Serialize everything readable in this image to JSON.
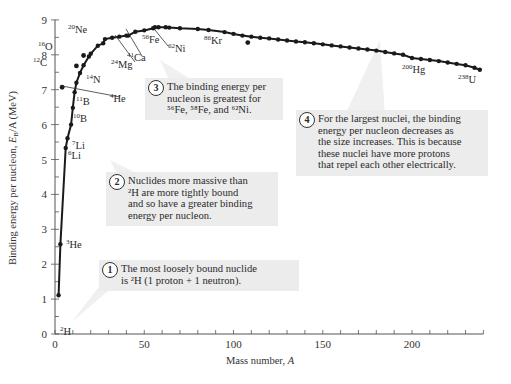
{
  "chart_data": {
    "type": "scatter",
    "title": "",
    "xlabel": "Mass number, A",
    "ylabel": "Binding energy per nucleon, E_B/A (MeV)",
    "xlim": [
      0,
      240
    ],
    "ylim": [
      0,
      9
    ],
    "x_ticks": [
      0,
      50,
      100,
      150,
      200
    ],
    "y_ticks": [
      0,
      1,
      2,
      3,
      4,
      5,
      6,
      7,
      8,
      9
    ],
    "grid": false,
    "labeled_points": [
      {
        "label": "2H",
        "mass": 2,
        "A": 2,
        "E": 1.11
      },
      {
        "label": "3He",
        "mass": 3,
        "A": 3,
        "E": 2.57
      },
      {
        "label": "4He",
        "mass": 4,
        "A": 4,
        "E": 7.07
      },
      {
        "label": "6Li",
        "mass": 6,
        "A": 6,
        "E": 5.33
      },
      {
        "label": "7Li",
        "mass": 7,
        "A": 7,
        "E": 5.61
      },
      {
        "label": "10B",
        "mass": 10,
        "A": 10,
        "E": 6.48
      },
      {
        "label": "11B",
        "mass": 11,
        "A": 11,
        "E": 6.93
      },
      {
        "label": "12C",
        "mass": 12,
        "A": 12,
        "E": 7.68
      },
      {
        "label": "14N",
        "mass": 14,
        "A": 14,
        "E": 7.48
      },
      {
        "label": "16O",
        "mass": 16,
        "A": 16,
        "E": 7.98
      },
      {
        "label": "20Ne",
        "mass": 20,
        "A": 20,
        "E": 8.03
      },
      {
        "label": "24Mg",
        "mass": 24,
        "A": 24,
        "E": 8.26
      },
      {
        "label": "41Ca",
        "mass": 41,
        "A": 41,
        "E": 8.55
      },
      {
        "label": "56Fe",
        "mass": 56,
        "A": 56,
        "E": 8.79
      },
      {
        "label": "62Ni",
        "mass": 62,
        "A": 62,
        "E": 8.79
      },
      {
        "label": "86Kr",
        "mass": 86,
        "A": 86,
        "E": 8.71
      },
      {
        "label": "200Hg",
        "mass": 200,
        "A": 200,
        "E": 7.91
      },
      {
        "label": "238U",
        "mass": 238,
        "A": 238,
        "E": 7.57
      }
    ],
    "series": [
      {
        "name": "curve_points",
        "x": [
          2,
          3,
          6,
          7,
          9,
          10,
          11,
          12,
          14,
          16,
          19,
          20,
          24,
          27,
          28,
          32,
          36,
          40,
          41,
          45,
          50,
          55,
          56,
          58,
          62,
          64,
          70,
          80,
          86,
          95,
          100,
          105,
          110,
          115,
          120,
          125,
          130,
          135,
          140,
          145,
          150,
          155,
          160,
          165,
          170,
          175,
          180,
          185,
          190,
          195,
          200,
          205,
          210,
          215,
          220,
          225,
          230,
          235,
          238
        ],
        "y": [
          1.11,
          2.57,
          5.33,
          5.61,
          6.0,
          6.48,
          6.93,
          7.2,
          7.48,
          7.7,
          7.95,
          8.03,
          8.26,
          8.33,
          8.45,
          8.49,
          8.52,
          8.55,
          8.55,
          8.66,
          8.7,
          8.76,
          8.79,
          8.79,
          8.79,
          8.78,
          8.76,
          8.74,
          8.71,
          8.65,
          8.6,
          8.55,
          8.52,
          8.49,
          8.47,
          8.44,
          8.41,
          8.38,
          8.36,
          8.33,
          8.3,
          8.27,
          8.24,
          8.21,
          8.18,
          8.15,
          8.12,
          8.08,
          8.04,
          8.0,
          7.91,
          7.88,
          7.85,
          7.82,
          7.78,
          7.74,
          7.7,
          7.63,
          7.57
        ]
      },
      {
        "name": "outliers",
        "x": [
          4,
          12,
          16,
          108
        ],
        "y": [
          7.07,
          7.68,
          7.98,
          8.35
        ]
      }
    ]
  },
  "axes": {
    "xlabel_text": "Mass number, ",
    "xlabel_var": "A",
    "ylabel_text": "Binding energy per nucleon, ",
    "ylabel_var": "E",
    "ylabel_sub": "B",
    "ylabel_rest": "/A (MeV)"
  },
  "callouts": [
    {
      "num": "1",
      "lines": [
        "The most loosely bound nuclide",
        "is ²H (1 proton + 1 neutron)."
      ]
    },
    {
      "num": "2",
      "lines": [
        "Nuclides more massive than",
        "²H are more tightly bound",
        "and so have a greater binding",
        "energy per nucleon."
      ]
    },
    {
      "num": "3",
      "lines": [
        "The binding energy per",
        "nucleon is greatest for",
        "⁵⁶Fe, ⁵⁸Fe, and ⁶²Ni."
      ]
    },
    {
      "num": "4",
      "lines": [
        "For the largest nuclei, the binding",
        "energy per nucleon decreases as",
        "the size increases. This is because",
        "these nuclei have more protons",
        "that repel each other electrically."
      ]
    }
  ],
  "colors": {
    "curve": "#1a1a1a",
    "callout_bg": "#ececec",
    "axis": "#555555"
  }
}
